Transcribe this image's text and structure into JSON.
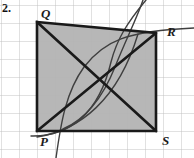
{
  "figure": {
    "problem_number": "2.",
    "kind": "geometry-diagram",
    "width": 194,
    "height": 158,
    "background_color": "#ffffff",
    "grid": {
      "visible": true,
      "color": "#b9b9b9",
      "spacing_px": 18,
      "origin_x": 1,
      "origin_y": 5,
      "columns": 11,
      "rows": 9
    },
    "shape": {
      "name": "quadrilateral-PQRS",
      "fill_color": "#b3b3b3",
      "stroke_color": "#1a1a1a",
      "stroke_width": 2.6,
      "vertices": [
        {
          "label": "Q",
          "x": 37,
          "y": 22
        },
        {
          "label": "R",
          "x": 156,
          "y": 33
        },
        {
          "label": "S",
          "x": 156,
          "y": 131
        },
        {
          "label": "P",
          "x": 37,
          "y": 131
        }
      ]
    },
    "diagonals": [
      {
        "name": "diagonal-PR",
        "from": "P",
        "to": "R",
        "x1": 37,
        "y1": 131,
        "x2": 156,
        "y2": 33,
        "color": "#1a1a1a",
        "width": 2.6
      },
      {
        "name": "diagonal-QS",
        "from": "Q",
        "to": "S",
        "x1": 37,
        "y1": 22,
        "x2": 156,
        "y2": 131,
        "color": "#1a1a1a",
        "width": 2.6
      }
    ],
    "curves": [
      {
        "name": "arc-lower-left-to-upper-right",
        "path": "M 37 137 C 80 130 118 100 138 34",
        "color": "#3a3a3a",
        "width": 1.5
      },
      {
        "name": "arc-bottom-left-sweep",
        "path": "M 33 136 C 70 136 100 112 112 60 C 118 38 128 24 146 0",
        "color": "#3a3a3a",
        "width": 1.5
      },
      {
        "name": "arc-through-P-to-R",
        "path": "M 55 158 C 62 120 68 90 86 66 C 106 40 128 30 194 27",
        "color": "#3a3a3a",
        "width": 1.5
      },
      {
        "name": "arc-long-right-sweep",
        "path": "M 64 128 C 86 118 104 96 116 66 C 128 36 138 18 144 0",
        "color": "#3a3a3a",
        "width": 1.5
      }
    ],
    "labels": [
      {
        "name": "vertex-label-Q",
        "text": "Q",
        "x": 41,
        "y": 7
      },
      {
        "name": "vertex-label-R",
        "text": "R",
        "x": 167,
        "y": 25
      },
      {
        "name": "vertex-label-P",
        "text": "P",
        "x": 40,
        "y": 135
      },
      {
        "name": "vertex-label-S",
        "text": "S",
        "x": 162,
        "y": 134
      }
    ]
  }
}
